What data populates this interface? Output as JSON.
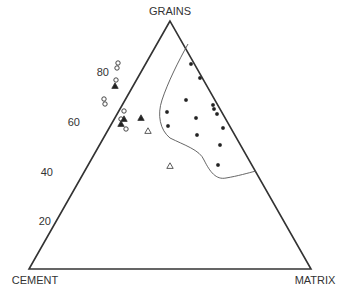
{
  "chart_data": {
    "type": "scatter",
    "subtype": "ternary",
    "title": "",
    "vertices": {
      "top": "GRAINS",
      "bottom_left": "CEMENT",
      "bottom_right": "MATRIX"
    },
    "left_axis_ticks": [
      "20",
      "40",
      "60",
      "80"
    ],
    "left_axis_tick_values": [
      20,
      40,
      60,
      80
    ],
    "series": [
      {
        "name": "open-circle",
        "marker": "open-circle",
        "points_px": [
          [
            118,
            63
          ],
          [
            117,
            68
          ],
          [
            116,
            80
          ],
          [
            104,
            99
          ],
          [
            105,
            104
          ],
          [
            124,
            111
          ],
          [
            121,
            119
          ],
          [
            126,
            129
          ]
        ]
      },
      {
        "name": "filled-triangle",
        "marker": "filled-triangle",
        "points_px": [
          [
            115,
            86
          ],
          [
            124,
            119
          ],
          [
            121,
            124
          ],
          [
            141,
            118
          ]
        ]
      },
      {
        "name": "open-triangle",
        "marker": "open-triangle",
        "points_px": [
          [
            148,
            131
          ],
          [
            170,
            166
          ]
        ]
      },
      {
        "name": "filled-circle",
        "marker": "filled-circle",
        "points_px": [
          [
            191,
            64
          ],
          [
            200,
            78
          ],
          [
            186,
            100
          ],
          [
            167,
            112
          ],
          [
            168,
            126
          ],
          [
            213,
            105
          ],
          [
            214,
            109
          ],
          [
            217,
            114
          ],
          [
            196,
            118
          ],
          [
            197,
            135
          ],
          [
            223,
            128
          ],
          [
            220,
            145
          ],
          [
            218,
            165
          ]
        ]
      }
    ],
    "field_boundary": {
      "description": "Closed curve enclosing filled-circle points, anchored to right edge",
      "path_px": "M188,44 C178,62 168,82 162,100 C157,115 160,130 170,138 C184,145 200,150 204,160 C210,172 216,180 226,178 C238,176 248,173 256,171"
    }
  }
}
